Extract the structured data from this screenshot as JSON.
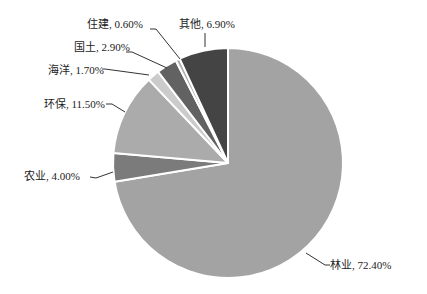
{
  "chart_data": {
    "type": "pie",
    "title": "",
    "start_angle": "12 o'clock",
    "direction": "clockwise",
    "categories": [
      "林业",
      "农业",
      "环保",
      "海洋",
      "国土",
      "住建",
      "其他"
    ],
    "values": [
      72.4,
      4.0,
      11.5,
      1.7,
      2.9,
      0.6,
      6.9
    ],
    "labels": [
      "林业, 72.40%",
      "农业, 4.00%",
      "环保, 11.50%",
      "海洋, 1.70%",
      "国土, 2.90%",
      "住建, 0.60%",
      "其他, 6.90%"
    ],
    "colors": [
      "#a3a3a3",
      "#7b7b7b",
      "#ababab",
      "#cbcbcb",
      "#626262",
      "#b2b2b2",
      "#444444"
    ],
    "legend": "none",
    "data_labels": "outside with leader lines"
  },
  "geometry": {
    "cx": 228,
    "cy": 163,
    "r": 115
  },
  "label_layout": [
    {
      "x": 330,
      "y": 259,
      "anchor": [
        [
          306,
          253
        ],
        [
          325,
          265
        ],
        [
          330,
          265
        ]
      ]
    },
    {
      "x": 24,
      "y": 170,
      "anchor": [
        [
          113,
          172
        ],
        [
          96,
          178
        ],
        [
          90,
          177
        ]
      ]
    },
    {
      "x": 44,
      "y": 98,
      "anchor": [
        [
          125,
          112
        ],
        [
          112,
          104
        ],
        [
          106,
          104
        ]
      ]
    },
    {
      "x": 48,
      "y": 64,
      "anchor": [
        [
          149,
          75
        ],
        [
          105,
          69
        ],
        [
          102,
          69
        ]
      ]
    },
    {
      "x": 74,
      "y": 41,
      "anchor": [
        [
          167,
          68
        ],
        [
          132,
          52
        ],
        [
          126,
          52
        ]
      ]
    },
    {
      "x": 87,
      "y": 18,
      "anchor": [
        [
          180,
          59
        ],
        [
          156,
          29
        ],
        [
          150,
          29
        ]
      ]
    },
    {
      "x": 179,
      "y": 18,
      "anchor": [
        [
          205,
          47
        ],
        [
          205,
          33
        ]
      ]
    }
  ]
}
